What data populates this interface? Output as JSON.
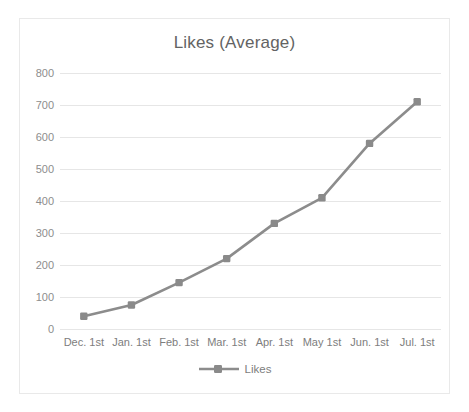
{
  "chart_data": {
    "type": "line",
    "title": "Likes (Average)",
    "xlabel": "",
    "ylabel": "",
    "categories": [
      "Dec. 1st",
      "Jan. 1st",
      "Feb. 1st",
      "Mar. 1st",
      "Apr. 1st",
      "May 1st",
      "Jun. 1st",
      "Jul. 1st"
    ],
    "series": [
      {
        "name": "Likes",
        "values": [
          40,
          75,
          145,
          220,
          330,
          410,
          580,
          710
        ]
      }
    ],
    "ylim": [
      0,
      800
    ],
    "yticks": [
      "0",
      "100",
      "200",
      "300",
      "400",
      "500",
      "600",
      "700",
      "800"
    ],
    "ytick_values": [
      0,
      100,
      200,
      300,
      400,
      500,
      600,
      700,
      800
    ],
    "grid": "horizontal",
    "legend_position": "bottom",
    "marker": "square",
    "colors": {
      "series_line": "#8c8c8c",
      "marker": "#8a8a8a",
      "gridline": "#e6e6e6",
      "title_text": "#636363",
      "tick_text": "#8d8d8d",
      "frame_border": "#e9e9e9",
      "background": "#ffffff"
    }
  },
  "legend": {
    "entries": [
      {
        "label": "Likes"
      }
    ]
  }
}
